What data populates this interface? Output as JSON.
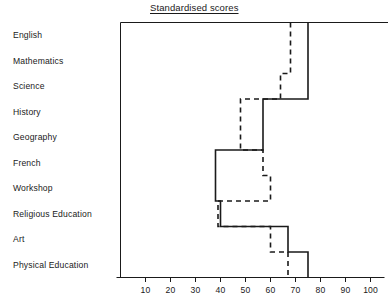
{
  "chart_data": {
    "type": "line",
    "orientation": "horizontal-step",
    "title": "Standardised scores",
    "xlabel": "",
    "ylabel": "",
    "xlim": [
      0,
      100
    ],
    "grid": false,
    "legend": "none",
    "x_ticks": [
      10,
      20,
      30,
      40,
      50,
      60,
      70,
      80,
      90,
      100
    ],
    "x_tick_labels": [
      "10",
      "20",
      "30",
      "40",
      "50",
      "60",
      "70",
      "80",
      "90",
      "100"
    ],
    "categories": [
      "English",
      "Mathematics",
      "Science",
      "History",
      "Geography",
      "French",
      "Workshop",
      "Religious Education",
      "Art",
      "Physical Education"
    ],
    "series": [
      {
        "name": "solid-profile",
        "style": "solid",
        "values": [
          75,
          75,
          75,
          57,
          57,
          38,
          38,
          40,
          67,
          75
        ]
      },
      {
        "name": "dashed-profile",
        "style": "dashed",
        "values": [
          68,
          68,
          64,
          48,
          48,
          57,
          60,
          39,
          60,
          67
        ]
      }
    ]
  },
  "axis": {
    "x_origin_value": 0,
    "x_max_value": 100
  }
}
